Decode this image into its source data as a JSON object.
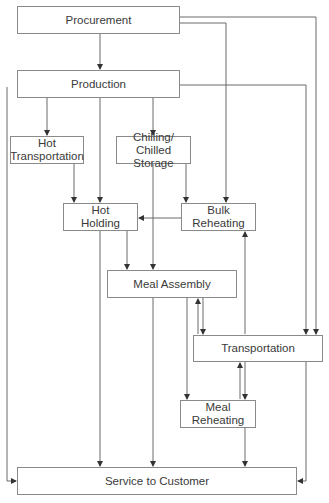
{
  "diagram": {
    "nodes": {
      "procurement": "Procurement",
      "production": "Production",
      "hot_transportation": "Hot\nTransportation",
      "chilling": "Chilling/\nChilled Storage",
      "hot_holding": "Hot\nHolding",
      "bulk_reheating": "Bulk\nReheating",
      "meal_assembly": "Meal Assembly",
      "transportation": "Transportation",
      "meal_reheating": "Meal\nReheating",
      "service": "Service to Customer"
    },
    "edges": [
      [
        "Procurement",
        "Production"
      ],
      [
        "Procurement",
        "Bulk Reheating"
      ],
      [
        "Procurement",
        "Transportation"
      ],
      [
        "Production",
        "Hot Transportation"
      ],
      [
        "Production",
        "Hot Holding"
      ],
      [
        "Production",
        "Chilling/Chilled Storage"
      ],
      [
        "Production",
        "Transportation"
      ],
      [
        "Production",
        "Service to Customer"
      ],
      [
        "Hot Transportation",
        "Hot Holding"
      ],
      [
        "Chilling/Chilled Storage",
        "Meal Assembly"
      ],
      [
        "Chilling/Chilled Storage",
        "Bulk Reheating"
      ],
      [
        "Bulk Reheating",
        "Hot Holding"
      ],
      [
        "Hot Holding",
        "Meal Assembly"
      ],
      [
        "Hot Holding",
        "Service to Customer"
      ],
      [
        "Meal Assembly",
        "Service to Customer"
      ],
      [
        "Meal Assembly",
        "Meal Reheating"
      ],
      [
        "Meal Assembly",
        "Transportation"
      ],
      [
        "Transportation",
        "Meal Assembly"
      ],
      [
        "Transportation",
        "Bulk Reheating"
      ],
      [
        "Transportation",
        "Meal Reheating"
      ],
      [
        "Meal Reheating",
        "Transportation"
      ],
      [
        "Transportation",
        "Service to Customer"
      ],
      [
        "Meal Reheating",
        "Service to Customer"
      ]
    ]
  }
}
